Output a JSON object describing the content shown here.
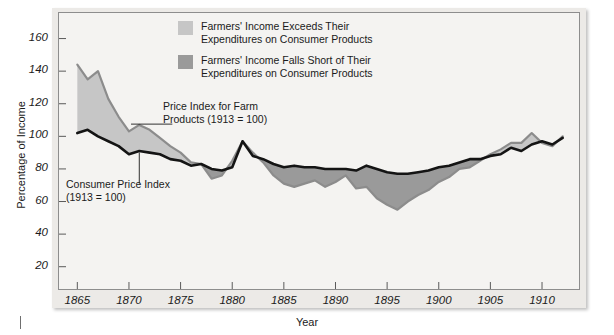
{
  "chart_data": {
    "type": "area",
    "title": "",
    "subtitle": "",
    "xlabel": "Year",
    "ylabel": "Percentage of Income",
    "xlim": [
      1864,
      1913
    ],
    "ylim": [
      10,
      172
    ],
    "grid": false,
    "legend_position": "top-right-inside",
    "xticks": [
      1865,
      1870,
      1875,
      1880,
      1885,
      1890,
      1895,
      1900,
      1905,
      1910
    ],
    "yticks": [
      20,
      40,
      60,
      80,
      100,
      120,
      140,
      160
    ],
    "x": [
      1865,
      1866,
      1867,
      1868,
      1869,
      1870,
      1871,
      1872,
      1873,
      1874,
      1875,
      1876,
      1877,
      1878,
      1879,
      1880,
      1881,
      1882,
      1883,
      1884,
      1885,
      1886,
      1887,
      1888,
      1889,
      1890,
      1891,
      1892,
      1893,
      1894,
      1895,
      1896,
      1897,
      1898,
      1899,
      1900,
      1901,
      1902,
      1903,
      1904,
      1905,
      1906,
      1907,
      1908,
      1909,
      1910,
      1911,
      1912
    ],
    "series": [
      {
        "name": "Price Index for Farm Products (1913 = 100)",
        "color": "#8c8c8c",
        "values": [
          144,
          135,
          140,
          123,
          112,
          103,
          107,
          104,
          99,
          94,
          90,
          84,
          83,
          74,
          76,
          85,
          97,
          90,
          84,
          76,
          71,
          69,
          71,
          73,
          69,
          72,
          76,
          68,
          69,
          62,
          58,
          55,
          60,
          64,
          67,
          72,
          75,
          80,
          81,
          85,
          89,
          92,
          96,
          96,
          102,
          96,
          94,
          100
        ]
      },
      {
        "name": "Consumer Price Index (1913 = 100)",
        "color": "#141414",
        "values": [
          102,
          104,
          100,
          97,
          94,
          89,
          91,
          90,
          89,
          86,
          85,
          82,
          83,
          80,
          79,
          81,
          97,
          88,
          86,
          83,
          81,
          82,
          81,
          81,
          80,
          80,
          80,
          79,
          82,
          80,
          78,
          77,
          77,
          78,
          79,
          81,
          82,
          84,
          86,
          86,
          88,
          89,
          93,
          91,
          95,
          97,
          95,
          99
        ]
      }
    ],
    "fills": [
      {
        "name": "Farmers' Income Exceeds Their Expenditures on Consumer Products",
        "color": "#c6c6c6",
        "meaning": "farm price index above consumer price index"
      },
      {
        "name": "Farmers' Income Falls Short of Their Expenditures on Consumer Products",
        "color": "#9a9a9a",
        "meaning": "farm price index below consumer price index"
      }
    ],
    "annotations": [
      {
        "text": "Price Index for Farm\nProducts (1913 = 100)",
        "target_x": 1873,
        "target_y": 103
      },
      {
        "text": "Consumer Price Index\n(1913 = 100)",
        "target_x": 1871,
        "target_y": 91
      }
    ]
  },
  "axis": {
    "ylabel": "Percentage of Income",
    "xlabel": "Year",
    "ytick_labels": [
      "160",
      "140",
      "120",
      "100",
      "80",
      "60",
      "40",
      "20"
    ],
    "xtick_labels": [
      "1865",
      "1870",
      "1875",
      "1880",
      "1885",
      "1890",
      "1895",
      "1900",
      "1905",
      "1910"
    ]
  },
  "legend": {
    "items": [
      {
        "label": "Farmers' Income Exceeds Their\nExpenditures on Consumer Products",
        "color": "#c6c6c6"
      },
      {
        "label": "Farmers' Income Falls Short of Their\nExpenditures on Consumer Products",
        "color": "#9a9a9a"
      }
    ]
  },
  "annotations": {
    "farm": "Price Index for Farm\nProducts (1913 = 100)",
    "cpi": "Consumer Price Index\n(1913 = 100)"
  },
  "colors": {
    "fill_light": "#c6c6c6",
    "fill_dark": "#9a9a9a",
    "line_farm": "#8c8c8c",
    "line_cpi": "#141414",
    "plot_bg": "#f4f3f1",
    "panel_bg": "#eceae7",
    "frame": "#8d8d8d"
  }
}
